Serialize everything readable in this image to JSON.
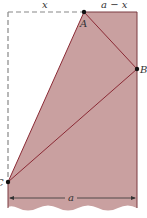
{
  "labels": {
    "x": "x",
    "a_minus_x": "a − x",
    "A": "A",
    "B": "B",
    "C": "C",
    "a": "a"
  },
  "colors": {
    "fill": "#c9a0a0",
    "line": "#8b2a35",
    "edge": "#7a3a40",
    "dashed": "#888888",
    "point": "#111111"
  }
}
